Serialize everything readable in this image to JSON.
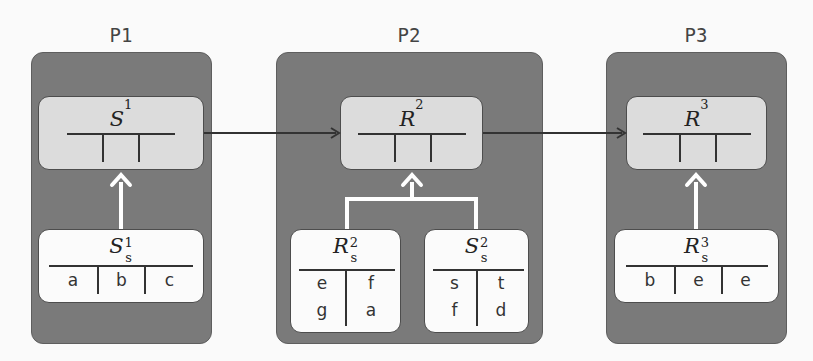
{
  "diagram": {
    "colors": {
      "panel": "#7a7a7a",
      "global_relation": "#dcdcdc",
      "local_relation": "#fbfbfb",
      "data_flow_arrow": "#333333",
      "local_load_arrow": "#ffffff"
    },
    "processes": [
      {
        "label": "P1",
        "global_relation": {
          "name": "S",
          "superscript": "1",
          "columns": 3,
          "rows": []
        },
        "local_relations": [
          {
            "name": "S",
            "superscript": "1",
            "subscript": "s",
            "columns": [
              "a",
              "b",
              "c"
            ],
            "rows": [
              [
                "a",
                "b",
                "c"
              ]
            ]
          }
        ]
      },
      {
        "label": "P2",
        "global_relation": {
          "name": "R",
          "superscript": "2",
          "columns": 3,
          "rows": []
        },
        "local_relations": [
          {
            "name": "R",
            "superscript": "2",
            "subscript": "s",
            "rows": [
              [
                "e",
                "f"
              ],
              [
                "g",
                "a"
              ]
            ]
          },
          {
            "name": "S",
            "superscript": "2",
            "subscript": "s",
            "rows": [
              [
                "s",
                "t"
              ],
              [
                "f",
                "d"
              ]
            ]
          }
        ]
      },
      {
        "label": "P3",
        "global_relation": {
          "name": "R",
          "superscript": "3",
          "columns": 3,
          "rows": []
        },
        "local_relations": [
          {
            "name": "R",
            "superscript": "3",
            "subscript": "s",
            "rows": [
              [
                "b",
                "e",
                "e"
              ]
            ]
          }
        ]
      }
    ],
    "edges": [
      {
        "from": "S^1",
        "to": "R^2",
        "style": "dark-arrow"
      },
      {
        "from": "R^2",
        "to": "R^3",
        "style": "dark-arrow"
      },
      {
        "from": "S_s^1",
        "to": "S^1",
        "style": "white-arrow"
      },
      {
        "from": "R_s^2",
        "to": "R^2",
        "style": "white-fork-arrow"
      },
      {
        "from": "S_s^2",
        "to": "R^2",
        "style": "white-fork-arrow"
      },
      {
        "from": "R_s^3",
        "to": "R^3",
        "style": "white-arrow"
      }
    ]
  }
}
